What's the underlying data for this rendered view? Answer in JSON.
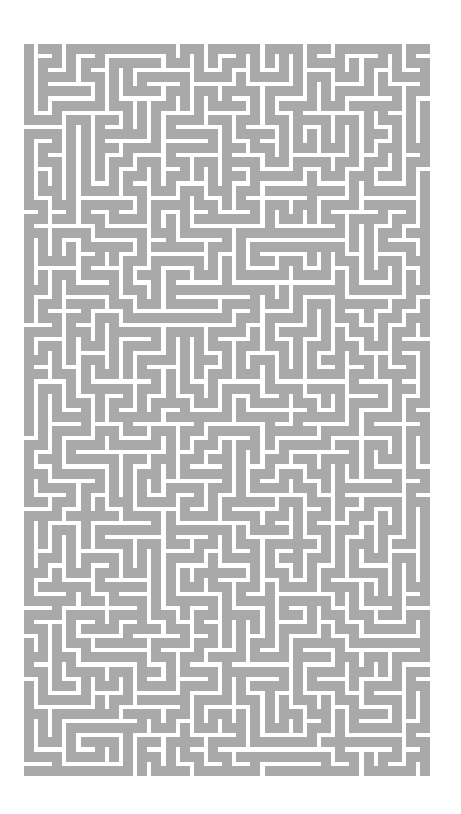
{
  "maze": {
    "label": "Maze",
    "background_color": "#ffffff",
    "wall_color": "#a9a9a9",
    "origin_x": 24,
    "origin_y": 44,
    "cols": 29,
    "rows": 52,
    "cell_size": 14.15,
    "block_size": 9.6,
    "seed": 20240611
  }
}
